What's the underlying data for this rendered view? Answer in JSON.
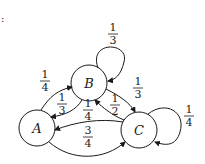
{
  "diagram": {
    "type": "markov-chain-state-diagram",
    "corner_mark": ":",
    "nodes": [
      {
        "id": "A",
        "label": "A"
      },
      {
        "id": "B",
        "label": "B"
      },
      {
        "id": "C",
        "label": "C"
      }
    ],
    "edges": [
      {
        "from": "B",
        "to": "B",
        "num": "1",
        "den": "3"
      },
      {
        "from": "A",
        "to": "B",
        "num": "1",
        "den": "4"
      },
      {
        "from": "B",
        "to": "A",
        "num": "1",
        "den": "3"
      },
      {
        "from": "B",
        "to": "C",
        "num": "1",
        "den": "3"
      },
      {
        "from": "C",
        "to": "B",
        "num": "1",
        "den": "2"
      },
      {
        "from": "C",
        "to": "A",
        "num": "1",
        "den": "4"
      },
      {
        "from": "A",
        "to": "C",
        "num": "3",
        "den": "4"
      },
      {
        "from": "C",
        "to": "C",
        "num": "1",
        "den": "4"
      }
    ]
  }
}
